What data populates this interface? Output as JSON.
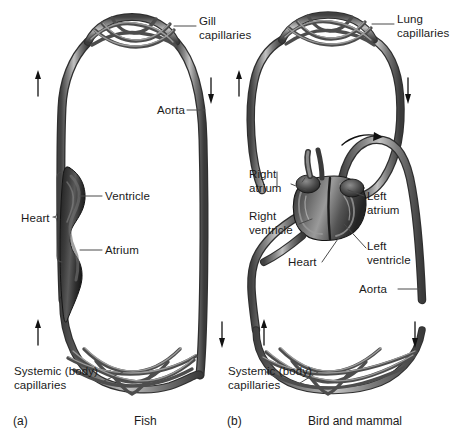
{
  "figure": {
    "background_color": "#ffffff",
    "vessel_dark": "#3b3b3b",
    "vessel_mid": "#6d6d6d",
    "vessel_light": "#b4b4b4",
    "heart_dark": "#2a2a2a",
    "label_color": "#1a1a1a",
    "leader_color": "#4a4a4a"
  },
  "panels": [
    {
      "id": "a",
      "letter": "(a)",
      "caption": "Fish",
      "labels": {
        "gill_capillaries": "Gill\ncapillaries",
        "aorta": "Aorta",
        "ventricle": "Ventricle",
        "heart": "Heart",
        "atrium": "Atrium",
        "systemic_capillaries": "Systemic (body)\ncapillaries"
      },
      "flow_arrows": [
        {
          "name": "upper-left-up-arrow",
          "direction": "up"
        },
        {
          "name": "upper-right-down-arrow",
          "direction": "down"
        },
        {
          "name": "lower-left-up-arrow",
          "direction": "up"
        },
        {
          "name": "lower-right-down-arrow",
          "direction": "down"
        }
      ]
    },
    {
      "id": "b",
      "letter": "(b)",
      "caption": "Bird and mammal",
      "labels": {
        "lung_capillaries": "Lung\ncapillaries",
        "right_atrium": "Right\natrium",
        "right_ventricle": "Right\nventricle",
        "left_atrium": "Left\natrium",
        "left_ventricle": "Left\nventricle",
        "heart": "Heart",
        "aorta": "Aorta",
        "systemic_capillaries": "Systemic (body)\ncapillaries"
      },
      "flow_arrows": [
        {
          "name": "upper-left-up-arrow",
          "direction": "up"
        },
        {
          "name": "upper-right-down-arrow",
          "direction": "down"
        },
        {
          "name": "lower-left-up-arrow",
          "direction": "up"
        },
        {
          "name": "lower-right-down-arrow",
          "direction": "down"
        },
        {
          "name": "aortic-arch-curved-arrow",
          "direction": "right"
        }
      ]
    }
  ]
}
